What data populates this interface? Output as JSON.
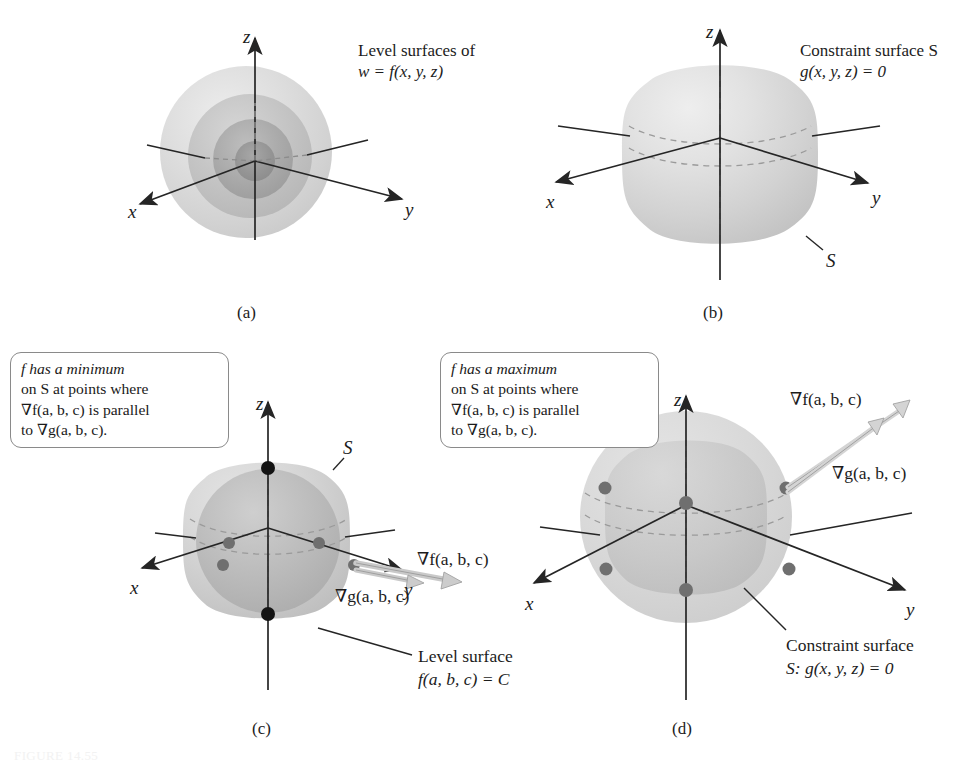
{
  "figure": {
    "domain": "math-diagram",
    "title_caption": "FIGURE 14.55",
    "colors": {
      "ink": "#1c1c1c",
      "axis": "#252525",
      "dashed_axis": "#8c8c8c",
      "surface_light": "#d9d9d9",
      "surface_mid": "#c4c4c4",
      "surface_dark": "#a8a8a8",
      "surface_darkest": "#8f8f8f",
      "dot_black": "#141414",
      "dot_gray": "#6f6f6f",
      "arrow_gray": "#b0b0b0",
      "callout_border": "#8a8a8a"
    }
  },
  "panels": [
    {
      "id": "a",
      "tag": "(a)",
      "note_lines": [
        "Level surfaces of",
        "w = f(x, y, z)"
      ],
      "axes": [
        "x",
        "y",
        "z"
      ],
      "description": "nested concentric level spheres"
    },
    {
      "id": "b",
      "tag": "(b)",
      "note_lines": [
        "Constraint surface S",
        "g(x, y, z) = 0"
      ],
      "axes": [
        "x",
        "y",
        "z"
      ],
      "surface_label": "S",
      "description": "rounded cube constraint surface"
    },
    {
      "id": "c",
      "tag": "(c)",
      "callout_lines": [
        "f has a minimum",
        "on S at points where",
        "∇f(a, b, c) is parallel",
        "to ∇g(a, b, c)."
      ],
      "axes": [
        "x",
        "y",
        "z"
      ],
      "surface_label": "S",
      "gradient_f_label": "∇f(a, b, c)",
      "gradient_g_label": "∇g(a, b, c)",
      "callout_bottom_lines": [
        "Level surface",
        "f(a, b, c) = C"
      ],
      "description": "inscribed level sphere inside constraint surface, tangency points marked"
    },
    {
      "id": "d",
      "tag": "(d)",
      "callout_lines": [
        "f has a maximum",
        "on S at points where",
        "∇f(a, b, c) is parallel",
        "to ∇g(a, b, c)."
      ],
      "axes": [
        "x",
        "y",
        "z"
      ],
      "gradient_f_label": "∇f(a, b, c)",
      "gradient_g_label": "∇g(a, b, c)",
      "callout_bottom_lines": [
        "Constraint surface",
        "S: g(x, y, z) = 0"
      ],
      "description": "circumscribed level sphere outside constraint surface, tangency points marked"
    }
  ]
}
